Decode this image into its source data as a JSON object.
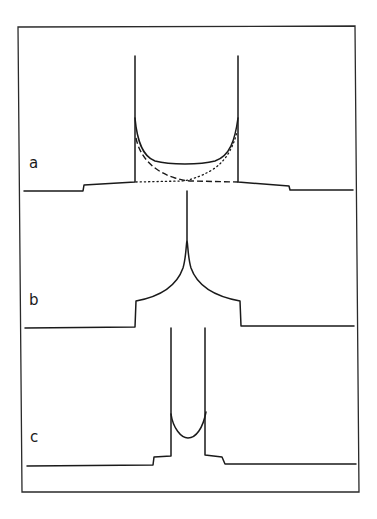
{
  "figure": {
    "panels": [
      {
        "label": "a",
        "description": "Two-spike spectrum with U-shaped solid envelope, plus dashed and dotted component curves that each fall off from one spike and run flat at the baseline"
      },
      {
        "label": "b",
        "description": "Single central sharp peak rising from a cusp-shaped plateau on a step pedestal"
      },
      {
        "label": "c",
        "description": "Narrow two-spike spectrum with small U-shaped bowl between spikes, on a small step pedestal"
      }
    ],
    "colors": {
      "line": "#1a1a1a",
      "frame": "#2a2a2a",
      "background": "#ffffff"
    },
    "legend_styles": [
      "solid",
      "dashed",
      "dotted"
    ]
  }
}
